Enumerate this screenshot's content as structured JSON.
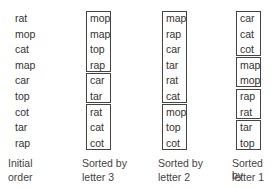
{
  "columns": [
    {
      "caption_line1": "Initial",
      "caption_line2": "order",
      "words": [
        "rat",
        "mop",
        "cat",
        "map",
        "car",
        "top",
        "cot",
        "tar",
        "rap"
      ],
      "groups": []
    },
    {
      "caption_line1": "Sorted by",
      "caption_line2": "letter 3",
      "words": [
        "mop",
        "map",
        "top",
        "rap",
        "car",
        "tar",
        "rat",
        "cat",
        "cot"
      ],
      "groups": [
        [
          0,
          3
        ],
        [
          4,
          5
        ],
        [
          6,
          8
        ]
      ]
    },
    {
      "caption_line1": "Sorted by",
      "caption_line2": "letter 2",
      "words": [
        "map",
        "rap",
        "car",
        "tar",
        "rat",
        "cat",
        "mop",
        "top",
        "cot"
      ],
      "groups": [
        [
          0,
          5
        ],
        [
          6,
          8
        ]
      ]
    },
    {
      "caption_line1": "Sorted by",
      "caption_line2": "letter 1",
      "words": [
        "car",
        "cat",
        "cot",
        "map",
        "mop",
        "rap",
        "rat",
        "tar",
        "top"
      ],
      "groups": [
        [
          0,
          2
        ],
        [
          3,
          4
        ],
        [
          5,
          6
        ],
        [
          7,
          8
        ]
      ]
    }
  ]
}
